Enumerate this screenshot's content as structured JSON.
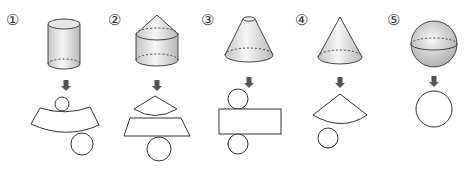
{
  "items": [
    {
      "label": "①",
      "solid": "cylinder",
      "net": "curved-band-with-two-circles"
    },
    {
      "label": "②",
      "solid": "cone-on-cylinder",
      "net": "sector-above-trapezoid-with-circle"
    },
    {
      "label": "③",
      "solid": "frustum",
      "net": "rectangle-with-two-circles"
    },
    {
      "label": "④",
      "solid": "cone",
      "net": "sector-with-circle"
    },
    {
      "label": "⑤",
      "solid": "sphere",
      "net": "circle"
    }
  ],
  "colors": {
    "stroke": "#333333",
    "shade_light": "#f4f4f4",
    "shade_dark": "#bdbdbd",
    "arrow": "#555555"
  }
}
